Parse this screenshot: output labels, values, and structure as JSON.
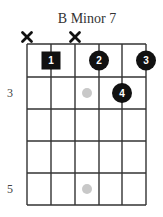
{
  "title": "B Minor 7",
  "colors": {
    "grid": "#333333",
    "finger": "#111111",
    "finger_text": "#ffffff",
    "inlay": "#c8c8c8",
    "background": "#ffffff"
  },
  "grid": {
    "strings": 6,
    "frets": 5,
    "string_x": [
      27,
      51,
      75,
      99,
      122,
      146
    ],
    "fret_y": [
      44,
      77,
      109,
      141,
      173,
      205
    ]
  },
  "muted_strings": [
    {
      "string": 1,
      "symbol": "×"
    },
    {
      "string": 3,
      "symbol": "×"
    }
  ],
  "fingers": [
    {
      "label": "1",
      "string": 2,
      "fret": 1,
      "shape": "square"
    },
    {
      "label": "2",
      "string": 4,
      "fret": 1,
      "shape": "circle"
    },
    {
      "label": "3",
      "string": 6,
      "fret": 1,
      "shape": "circle"
    },
    {
      "label": "4",
      "string": 5,
      "fret": 2,
      "shape": "circle"
    }
  ],
  "inlays": [
    {
      "fret": 2,
      "x": 87
    },
    {
      "fret": 5,
      "x": 87
    }
  ],
  "fret_numbers": [
    {
      "label": "3",
      "fret": 2
    },
    {
      "label": "5",
      "fret": 5
    }
  ]
}
